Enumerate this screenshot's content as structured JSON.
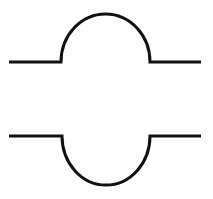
{
  "diagram": {
    "background": "#ffffff",
    "stroke_color": "#111111",
    "stroke_width": 3,
    "shapes": [
      {
        "name": "convex-bump-profile",
        "description": "horizontal line with upward semicircular bump",
        "baseline_y": 62,
        "left_x": 9,
        "arc_start_x": 61,
        "arc_end_x": 150,
        "right_x": 201,
        "peak_y": 14
      },
      {
        "name": "concave-dip-profile",
        "description": "horizontal line with downward semicircular dip",
        "baseline_y": 136,
        "left_x": 9,
        "arc_start_x": 62,
        "arc_end_x": 150,
        "right_x": 201,
        "trough_y": 185
      }
    ]
  }
}
